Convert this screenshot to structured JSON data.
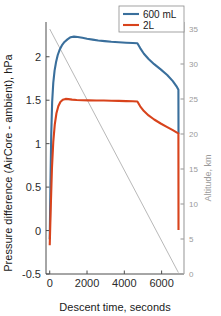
{
  "chart_data": {
    "type": "line",
    "title": "",
    "xlabel": "Descent time, seconds",
    "ylabel": "Pressure difference (AirCore - ambient), hPa",
    "y2label": "Altitude, km",
    "xlim": [
      -200,
      7200
    ],
    "ylim": [
      -0.5,
      2.4
    ],
    "y2lim": [
      0,
      36
    ],
    "xticks": [
      0,
      2000,
      4000,
      6000
    ],
    "xticklabels": [
      "0",
      "2000",
      "4000",
      "6000"
    ],
    "yticks": [
      -0.5,
      0,
      0.5,
      1,
      1.5,
      2
    ],
    "yticklabels": [
      "-0.5",
      "0",
      "0.5",
      "1",
      "1.5",
      "2"
    ],
    "y2ticks": [
      0,
      5,
      10,
      15,
      20,
      25,
      30,
      35
    ],
    "y2ticklabels": [
      "0",
      "5",
      "10",
      "15",
      "20",
      "25",
      "30",
      "35"
    ],
    "grid": false,
    "legend_position": "top-right",
    "colors": {
      "series_600mL": "#3a6f9c",
      "series_2L": "#d8431c",
      "altitude_line": "#a6a6a6",
      "left_axis": "#4d4d4d",
      "right_axis": "#a6a6a6",
      "background": "#ffffff"
    },
    "series": [
      {
        "name": "600 mL",
        "color": "#3a6f9c",
        "axis": "left",
        "points": [
          [
            0,
            -0.1
          ],
          [
            40,
            0.55
          ],
          [
            80,
            1.1
          ],
          [
            130,
            1.48
          ],
          [
            190,
            1.7
          ],
          [
            260,
            1.84
          ],
          [
            340,
            1.94
          ],
          [
            430,
            2.02
          ],
          [
            530,
            2.08
          ],
          [
            650,
            2.13
          ],
          [
            790,
            2.17
          ],
          [
            950,
            2.2
          ],
          [
            1120,
            2.225
          ],
          [
            1300,
            2.232
          ],
          [
            1500,
            2.228
          ],
          [
            1750,
            2.218
          ],
          [
            2000,
            2.207
          ],
          [
            2300,
            2.197
          ],
          [
            2600,
            2.188
          ],
          [
            2950,
            2.18
          ],
          [
            3300,
            2.173
          ],
          [
            3700,
            2.167
          ],
          [
            4100,
            2.162
          ],
          [
            4450,
            2.158
          ],
          [
            4700,
            2.155
          ],
          [
            4850,
            2.1
          ],
          [
            5050,
            2.035
          ],
          [
            5300,
            1.975
          ],
          [
            5600,
            1.915
          ],
          [
            5950,
            1.855
          ],
          [
            6300,
            1.79
          ],
          [
            6600,
            1.72
          ],
          [
            6800,
            1.66
          ],
          [
            6900,
            1.62
          ],
          [
            6905,
            1.115
          ]
        ]
      },
      {
        "name": "2L",
        "color": "#d8431c",
        "axis": "left",
        "points": [
          [
            0,
            -0.17
          ],
          [
            60,
            0.3
          ],
          [
            120,
            0.72
          ],
          [
            190,
            1.02
          ],
          [
            270,
            1.22
          ],
          [
            360,
            1.35
          ],
          [
            460,
            1.43
          ],
          [
            570,
            1.48
          ],
          [
            700,
            1.505
          ],
          [
            850,
            1.515
          ],
          [
            1000,
            1.512
          ],
          [
            1200,
            1.507
          ],
          [
            1450,
            1.503
          ],
          [
            1750,
            1.5
          ],
          [
            2100,
            1.498
          ],
          [
            2500,
            1.497
          ],
          [
            2900,
            1.496
          ],
          [
            3300,
            1.494
          ],
          [
            3700,
            1.492
          ],
          [
            4100,
            1.49
          ],
          [
            4450,
            1.488
          ],
          [
            4700,
            1.485
          ],
          [
            4850,
            1.43
          ],
          [
            5050,
            1.375
          ],
          [
            5300,
            1.325
          ],
          [
            5600,
            1.278
          ],
          [
            5950,
            1.232
          ],
          [
            6300,
            1.19
          ],
          [
            6600,
            1.155
          ],
          [
            6800,
            1.13
          ],
          [
            6900,
            1.118
          ],
          [
            6905,
            0.005
          ]
        ]
      }
    ],
    "altitude_line": {
      "name": "altitude-descent-line",
      "color": "#a6a6a6",
      "axis": "right",
      "points": [
        [
          0,
          35.0
        ],
        [
          6900,
          0.2
        ]
      ]
    }
  },
  "legend": {
    "entries": [
      {
        "label": "600 mL",
        "color": "#3a6f9c"
      },
      {
        "label": "2L",
        "color": "#d8431c"
      }
    ]
  }
}
